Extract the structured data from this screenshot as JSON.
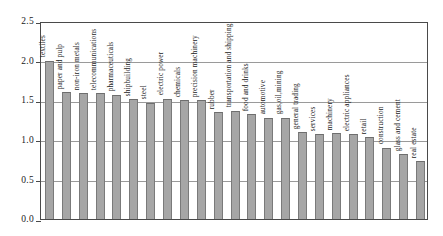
{
  "chart_data": {
    "type": "bar",
    "title": "",
    "subtitle": "",
    "xlabel": "",
    "ylabel": "",
    "ylim": [
      0.0,
      2.5
    ],
    "grid": true,
    "legend": "none",
    "orientation": "vertical",
    "bar_color": "#a6a6a6",
    "bar_edge_color": "#6e6e6e",
    "axis_color": "#4a4a4a",
    "gridline_color": "#9a9a9a",
    "ytick_labels": [
      "0.0",
      "0.5",
      "1.0",
      "1.5",
      "2.0",
      "2.5"
    ],
    "ytick_values": [
      0.0,
      0.5,
      1.0,
      1.5,
      2.0,
      2.5
    ],
    "categories": [
      "textiles",
      "paper and pulp",
      "non-iron metals",
      "telecommunications",
      "pharmaceuticals",
      "shipbuilding",
      "steel",
      "electric power",
      "chemicals",
      "precision machinery",
      "rubber",
      "transportation and shipping",
      "food and drinks",
      "automotive",
      "gas,oil,mining",
      "general trading",
      "services",
      "machinery",
      "electric appliances",
      "retail",
      "construction",
      "glass and cement",
      "real estate"
    ],
    "values": [
      2.0,
      1.6,
      1.59,
      1.59,
      1.57,
      1.51,
      1.47,
      1.52,
      1.5,
      1.5,
      1.35,
      1.37,
      1.32,
      1.28,
      1.28,
      1.1,
      1.07,
      1.08,
      1.07,
      1.03,
      0.9,
      0.82,
      0.73
    ]
  }
}
